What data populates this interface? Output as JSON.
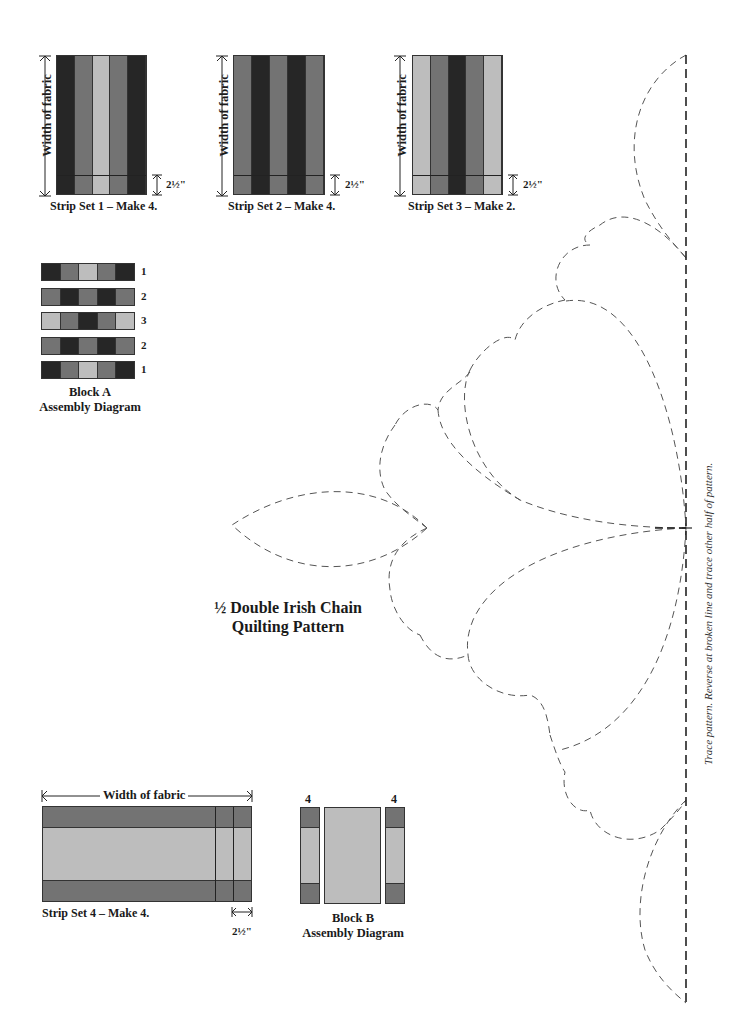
{
  "colors": {
    "dark": "#262626",
    "medium": "#737373",
    "light": "#bdbdbd",
    "outline": "#333333",
    "pattern_line": "#555555"
  },
  "strip_sets": [
    {
      "caption": "Strip Set 1 – Make 4.",
      "side_label": "Width of fabric",
      "cut_label": "2½\"",
      "strips": [
        "dark",
        "medium",
        "light",
        "medium",
        "dark"
      ]
    },
    {
      "caption": "Strip Set 2 – Make 4.",
      "side_label": "Width of fabric",
      "cut_label": "2½\"",
      "strips": [
        "medium",
        "dark",
        "medium",
        "dark",
        "medium"
      ]
    },
    {
      "caption": "Strip Set 3 – Make 2.",
      "side_label": "Width of fabric",
      "cut_label": "2½\"",
      "strips": [
        "light",
        "medium",
        "dark",
        "medium",
        "light"
      ]
    }
  ],
  "block_a": {
    "caption_line1": "Block A",
    "caption_line2": "Assembly Diagram",
    "rows": [
      {
        "num": "1",
        "cells": [
          "dark",
          "medium",
          "light",
          "medium",
          "dark"
        ]
      },
      {
        "num": "2",
        "cells": [
          "medium",
          "dark",
          "medium",
          "dark",
          "medium"
        ]
      },
      {
        "num": "3",
        "cells": [
          "light",
          "medium",
          "dark",
          "medium",
          "light"
        ]
      },
      {
        "num": "2",
        "cells": [
          "medium",
          "dark",
          "medium",
          "dark",
          "medium"
        ]
      },
      {
        "num": "1",
        "cells": [
          "dark",
          "medium",
          "light",
          "medium",
          "dark"
        ]
      }
    ]
  },
  "quilting_pattern": {
    "title_line1": "½ Double Irish Chain",
    "title_line2": "Quilting Pattern",
    "side_note": "Trace pattern. Reverse at broken line and trace other half of pattern."
  },
  "strip_set_4": {
    "top_label": "Width of fabric",
    "caption": "Strip Set 4 – Make 4.",
    "cut_label": "2½\"",
    "strips": [
      "medium",
      "light",
      "medium"
    ]
  },
  "block_b": {
    "label_left": "4",
    "label_right": "4",
    "caption_line1": "Block B",
    "caption_line2": "Assembly Diagram"
  }
}
